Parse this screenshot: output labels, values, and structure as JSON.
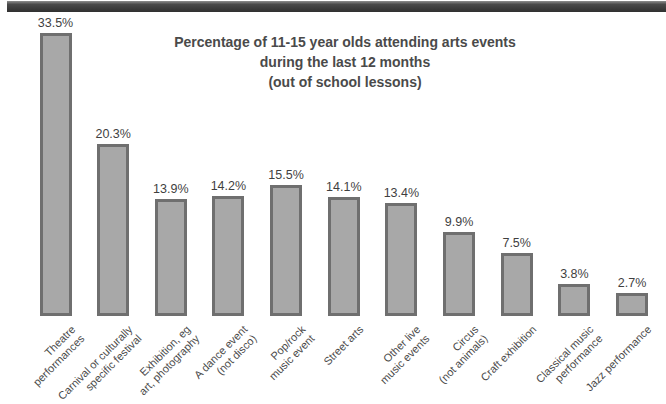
{
  "chart_data": {
    "type": "bar",
    "title": "Percentage of 11-15 year olds attending arts events during the last 12 months (out of school lessons)",
    "title_lines": [
      "Percentage of 11-15 year olds attending arts events",
      "during the last 12 months",
      "(out of school lessons)"
    ],
    "categories": [
      "Theatre performances",
      "Carnival or culturally specific festival",
      "Exhibition, eg art, photography",
      "A dance event (not disco)",
      "Pop/rock music event",
      "Street arts",
      "Other live music events",
      "Circus (not animals)",
      "Craft exhibition",
      "Classical music performance",
      "Jazz performance"
    ],
    "category_lines": [
      [
        "Theatre",
        "performances"
      ],
      [
        "Carnival or culturally",
        "specific festival"
      ],
      [
        "Exhibition, eg",
        "art, photography"
      ],
      [
        "A dance event",
        "(not disco)"
      ],
      [
        "Pop/rock",
        "music event"
      ],
      [
        "Street arts"
      ],
      [
        "Other live",
        "music events"
      ],
      [
        "Circus",
        "(not animals)"
      ],
      [
        "Craft exhibition"
      ],
      [
        "Classical music",
        "performance"
      ],
      [
        "Jazz performance"
      ]
    ],
    "values": [
      33.5,
      20.3,
      13.9,
      14.2,
      15.5,
      14.1,
      13.4,
      9.9,
      7.5,
      3.8,
      2.7
    ],
    "value_labels": [
      "33.5%",
      "20.3%",
      "13.9%",
      "14.2%",
      "15.5%",
      "14.1%",
      "13.4%",
      "9.9%",
      "7.5%",
      "3.8%",
      "2.7%"
    ],
    "unit": "%",
    "ylim": [
      0,
      35
    ],
    "grid": false,
    "legend": false,
    "colors": {
      "bar_fill": "#a8a8a8",
      "bar_border": "#6f6f6f",
      "title_text": "#4a4a4a",
      "label_text": "#4a4a4a",
      "header_bar": "#3c3c3c"
    }
  }
}
